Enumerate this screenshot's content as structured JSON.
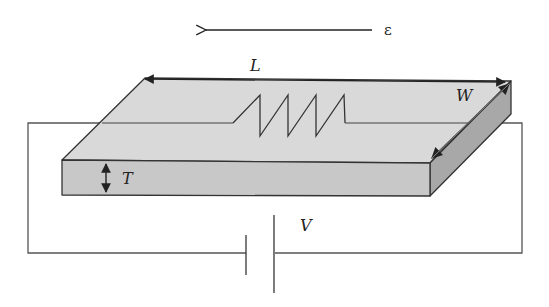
{
  "diagram": {
    "labels": {
      "strain": "ε",
      "length": "L",
      "width": "W",
      "thickness": "T",
      "voltage": "V"
    },
    "colors": {
      "top_face": "#d9d9d9",
      "front_face": "#c8c8c8",
      "side_face": "#a8a8a8",
      "stroke": "#333333",
      "wire": "#555555"
    }
  }
}
